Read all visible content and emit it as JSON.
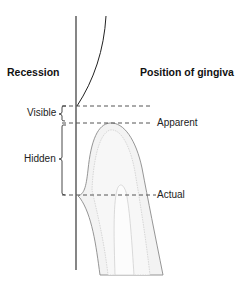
{
  "diagram": {
    "headings": {
      "left": "Recession",
      "right": "Position of gingiva"
    },
    "recession_labels": {
      "visible": "Visible",
      "hidden": "Hidden"
    },
    "gingiva_positions": {
      "apparent": "Apparent",
      "actual": "Actual"
    },
    "caption_partial": "",
    "colors": {
      "line": "#222222",
      "dash": "#555555",
      "tooth_outline": "#888888",
      "tooth_fill": "#f2f2f2",
      "pulp_fill": "#fafafa"
    }
  }
}
